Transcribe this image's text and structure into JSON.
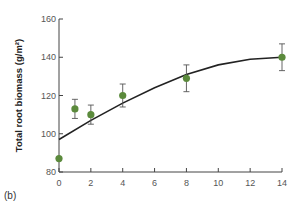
{
  "chart_data": {
    "type": "scatter",
    "title": "",
    "xlabel": "",
    "ylabel": "Total root biomass (g/m²)",
    "xlim": [
      0,
      14
    ],
    "ylim": [
      80,
      160
    ],
    "x_ticks": [
      0,
      2,
      4,
      6,
      8,
      10,
      12,
      14
    ],
    "y_ticks": [
      80,
      100,
      120,
      140,
      160
    ],
    "grid": false,
    "legend": null,
    "series": [
      {
        "name": "observed",
        "marker_color": "#5b8a3c",
        "points": [
          {
            "x": 0,
            "y": 87,
            "err": 0
          },
          {
            "x": 1,
            "y": 113,
            "err": 5
          },
          {
            "x": 2,
            "y": 110,
            "err": 5
          },
          {
            "x": 4,
            "y": 120,
            "err": 6
          },
          {
            "x": 8,
            "y": 129,
            "err": 7
          },
          {
            "x": 14,
            "y": 140,
            "err": 7
          }
        ]
      },
      {
        "name": "fitted curve",
        "line_color": "#222222",
        "points": [
          {
            "x": 0,
            "y": 97
          },
          {
            "x": 2,
            "y": 107
          },
          {
            "x": 4,
            "y": 116
          },
          {
            "x": 6,
            "y": 124
          },
          {
            "x": 8,
            "y": 131
          },
          {
            "x": 10,
            "y": 136
          },
          {
            "x": 12,
            "y": 139
          },
          {
            "x": 14,
            "y": 140
          }
        ]
      }
    ],
    "annotations": [
      "(b)"
    ]
  },
  "panel_label": "(b)"
}
